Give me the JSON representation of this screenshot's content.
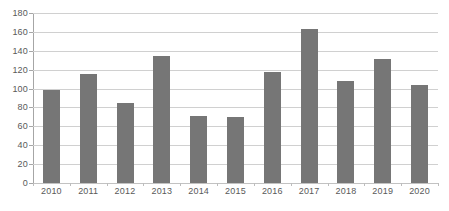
{
  "chart_data": {
    "type": "bar",
    "title": "",
    "subtitle": "",
    "xlabel": "",
    "ylabel": "",
    "categories": [
      "2010",
      "2011",
      "2012",
      "2013",
      "2014",
      "2015",
      "2016",
      "2017",
      "2018",
      "2019",
      "2020"
    ],
    "values": [
      99,
      115,
      85,
      134,
      71,
      70,
      118,
      163,
      108,
      131,
      104
    ],
    "ylim": [
      0,
      180
    ],
    "y_ticks": [
      0,
      20,
      40,
      60,
      80,
      100,
      120,
      140,
      160,
      180
    ],
    "y_tick_labels": [
      "0",
      "20",
      "40",
      "60",
      "80",
      "100",
      "120",
      "140",
      "160",
      "180"
    ],
    "grid": true,
    "grid_axis": "y",
    "legend": false,
    "legend_position": "none",
    "series": [
      {
        "name": "",
        "values": [
          99,
          115,
          85,
          134,
          71,
          70,
          118,
          163,
          108,
          131,
          104
        ]
      }
    ]
  },
  "style": {
    "bar_color": "#767676",
    "gridline_color": "#d0d0d0",
    "axis_color": "#a6a6a6",
    "tick_label_color": "#595959",
    "background_color": "#ffffff"
  }
}
